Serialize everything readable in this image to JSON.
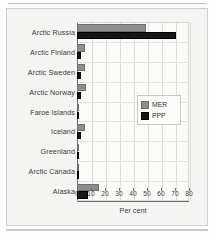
{
  "figure": {
    "xlabel_text": "Per cent"
  },
  "legend": {
    "position": "center-right",
    "entries": [
      {
        "label": "MER",
        "color": "#8e8e8e"
      },
      {
        "label": "PPP",
        "color": "#151515"
      }
    ]
  },
  "axis": {
    "ticks": [
      "0",
      "10",
      "20",
      "30",
      "40",
      "50",
      "60",
      "70",
      "80"
    ]
  },
  "chart_data": {
    "type": "bar",
    "orientation": "horizontal",
    "title": "",
    "subtitle": "",
    "xlabel": "Per cent",
    "ylabel": "",
    "xlim": [
      0,
      80
    ],
    "xticks": [
      0,
      10,
      20,
      30,
      40,
      50,
      60,
      70,
      80
    ],
    "grid": true,
    "legend": [
      "MER",
      "PPP"
    ],
    "legend_position": "center-right",
    "categories": [
      "Arctic Russia",
      "Arctic Finland",
      "Arctic Sweden",
      "Arctic Norway",
      "Faroe Islands",
      "Iceland",
      "Greenland",
      "Arctic Canada",
      "Alaska"
    ],
    "series": [
      {
        "name": "MER",
        "color": "#8e8e8e",
        "values": [
          49,
          6,
          6,
          6.5,
          0.4,
          6,
          0.3,
          1.5,
          16
        ]
      },
      {
        "name": "PPP",
        "color": "#151515",
        "values": [
          71,
          3,
          2.5,
          2.5,
          0.3,
          3,
          0.2,
          1,
          8
        ]
      }
    ]
  }
}
